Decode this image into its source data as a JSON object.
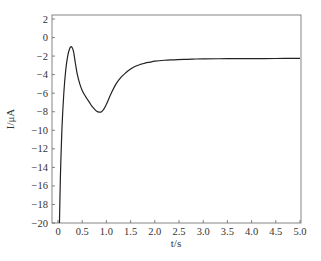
{
  "chart_data": {
    "type": "line",
    "title": "",
    "xlabel": "t/s",
    "ylabel": "I/μA",
    "xlim": [
      0,
      5.0
    ],
    "ylim": [
      -20,
      2.5
    ],
    "grid": false,
    "legend": null,
    "x_ticks": [
      "0",
      "0.5",
      "1.0",
      "1.5",
      "2.0",
      "2.5",
      "3.0",
      "3.5",
      "4.0",
      "4.5",
      "5.0"
    ],
    "y_ticks": [
      "2",
      "0",
      "−2",
      "−4",
      "−6",
      "−8",
      "−10",
      "−12",
      "−14",
      "−16",
      "−18",
      "−20"
    ],
    "series": [
      {
        "name": "current",
        "x": [
          0.03,
          0.05,
          0.08,
          0.12,
          0.16,
          0.2,
          0.24,
          0.28,
          0.32,
          0.36,
          0.4,
          0.45,
          0.5,
          0.55,
          0.6,
          0.65,
          0.7,
          0.75,
          0.8,
          0.85,
          0.9,
          0.95,
          1.0,
          1.05,
          1.1,
          1.2,
          1.3,
          1.4,
          1.5,
          1.6,
          1.7,
          1.8,
          1.9,
          2.0,
          2.2,
          2.4,
          2.6,
          2.8,
          3.0,
          3.5,
          4.0,
          4.5,
          5.0
        ],
        "y": [
          -20,
          -15,
          -10,
          -6,
          -3.5,
          -2,
          -1.2,
          -1.0,
          -1.5,
          -2.8,
          -4.0,
          -5.0,
          -5.7,
          -6.2,
          -6.6,
          -7.0,
          -7.4,
          -7.7,
          -7.95,
          -8.05,
          -8.0,
          -7.7,
          -7.2,
          -6.6,
          -6.0,
          -5.0,
          -4.3,
          -3.8,
          -3.4,
          -3.1,
          -2.9,
          -2.75,
          -2.65,
          -2.55,
          -2.45,
          -2.4,
          -2.35,
          -2.32,
          -2.3,
          -2.28,
          -2.27,
          -2.26,
          -2.25
        ]
      }
    ]
  }
}
